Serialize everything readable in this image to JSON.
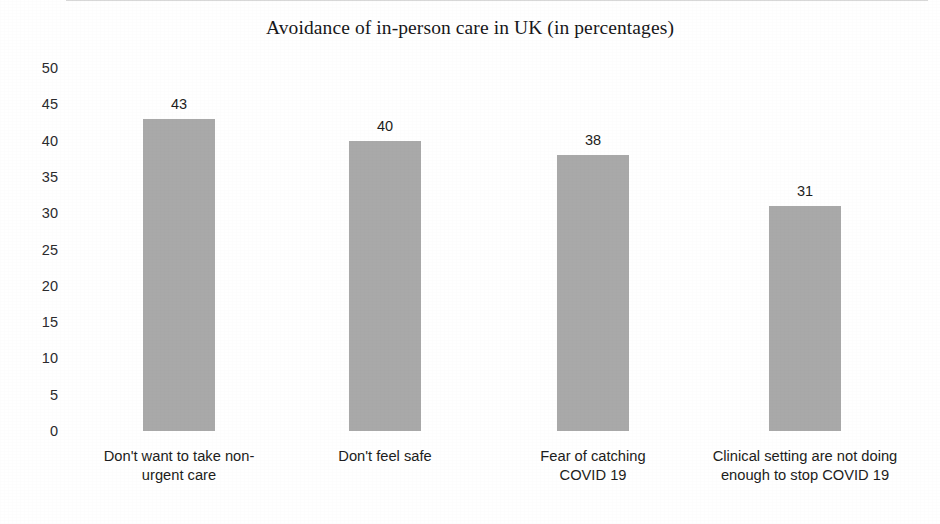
{
  "chart_data": {
    "type": "bar",
    "title": "Avoidance of in-person care in UK (in percentages)",
    "xlabel": "",
    "ylabel": "",
    "categories": [
      "Don't want to take non-urgent care",
      "Don't feel safe",
      "Fear of catching COVID 19",
      "Clinical setting are not doing enough to stop COVID 19"
    ],
    "category_lines": [
      [
        "Don't want to take non-",
        "urgent care"
      ],
      [
        "Don't feel safe",
        ""
      ],
      [
        "Fear of catching",
        "COVID 19"
      ],
      [
        "Clinical setting are not doing",
        "enough to stop COVID 19"
      ]
    ],
    "values": [
      43,
      40,
      38,
      31
    ],
    "value_labels": [
      "43",
      "40",
      "38",
      "31"
    ],
    "ylim": [
      0,
      50
    ],
    "ytick_step": 5,
    "yticks": [
      "50",
      "45",
      "40",
      "35",
      "30",
      "25",
      "20",
      "15",
      "10",
      "5",
      "0"
    ],
    "grid": false,
    "legend": null,
    "bar_color": "#a9a9a9",
    "text_color": "#1d1d20",
    "background_color": "#ffffff"
  }
}
